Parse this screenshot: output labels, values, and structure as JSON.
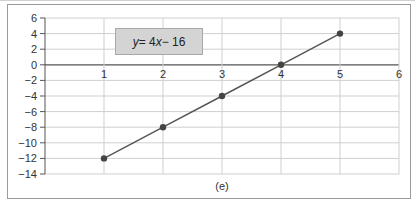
{
  "chart_data": {
    "type": "line",
    "title": "",
    "equation": "y = 4x − 16",
    "equation_parts": {
      "y": "y",
      "eq": " = 4",
      "x": "x",
      "rest": " − 16"
    },
    "caption": "(e)",
    "xlabel": "",
    "ylabel": "",
    "xlim": [
      0,
      6
    ],
    "ylim": [
      -14,
      6
    ],
    "x_ticks": [
      1,
      2,
      3,
      4,
      5,
      6
    ],
    "y_ticks": [
      6,
      4,
      2,
      0,
      -2,
      -4,
      -6,
      -8,
      -10,
      -12,
      -14
    ],
    "y_tick_labels": [
      "6",
      "4",
      "2",
      "0",
      "−2",
      "−4",
      "−6",
      "−8",
      "−10",
      "−12",
      "−14"
    ],
    "grid": true,
    "series": [
      {
        "name": "y = 4x - 16",
        "x": [
          1,
          2,
          3,
          4,
          5
        ],
        "values": [
          -12,
          -8,
          -4,
          0,
          4
        ],
        "color": "#555555",
        "marker": "circle"
      }
    ],
    "legend": "none"
  }
}
